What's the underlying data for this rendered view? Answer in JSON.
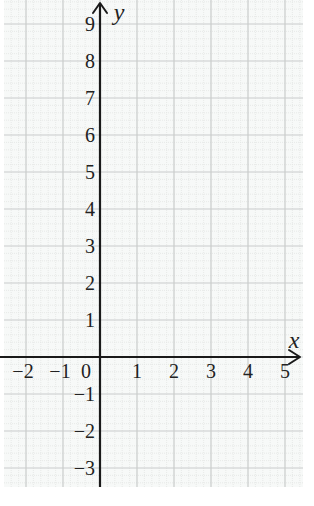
{
  "chart_data": {
    "type": "line",
    "title": "",
    "subtitle": "",
    "xlabel": "x",
    "ylabel": "y",
    "xlim": [
      -2.7,
      5.45
    ],
    "ylim": [
      -3.5,
      9.65
    ],
    "x_ticks": [
      -2,
      -1,
      1,
      2,
      3,
      4,
      5
    ],
    "x_tick_labels": [
      "−2",
      "−1",
      "1",
      "2",
      "3",
      "4",
      "5"
    ],
    "y_ticks": [
      -3,
      -2,
      -1,
      1,
      2,
      3,
      4,
      5,
      6,
      7,
      8,
      9
    ],
    "y_tick_labels": [
      "−3",
      "−2",
      "−1",
      "1",
      "2",
      "3",
      "4",
      "5",
      "6",
      "7",
      "8",
      "9"
    ],
    "origin_label": "0",
    "grid": true,
    "grid_major_step": 1,
    "grid_minor_subdivisions": 5,
    "series": [],
    "legend": null
  },
  "layout": {
    "origin_px": [
      100,
      357
    ],
    "unit_px": 37,
    "grid_left_px": 4,
    "grid_right_px": 303,
    "grid_top_px": 0,
    "grid_bottom_px": 487
  },
  "colors": {
    "major_grid": "#c9cccb",
    "minor_grid": "#e3e6e5",
    "axis": "#1a1a1a",
    "paper": "#f7f9f8"
  }
}
